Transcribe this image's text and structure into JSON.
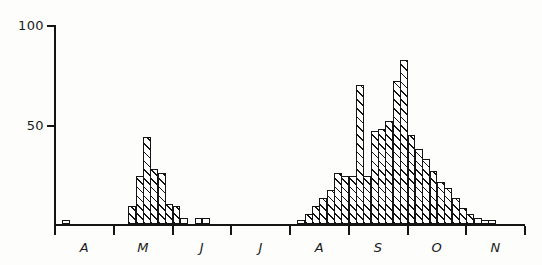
{
  "chart_data": {
    "type": "bar",
    "title": "",
    "subtitle": "",
    "xlabel": "",
    "ylabel": "",
    "xlim": [
      0,
      64
    ],
    "ylim": [
      0,
      100
    ],
    "grid": false,
    "legend": null,
    "note": "Histogram of weekly counts; bins are ~8.5 px wide, months April through November labelled by initial letter.",
    "yticks": [
      50,
      100
    ],
    "ytick_labels": [
      "50",
      "100"
    ],
    "month_labels": [
      "A",
      "M",
      "J",
      "J",
      "A",
      "S",
      "O",
      "N"
    ],
    "month_boundaries": [
      0,
      8,
      16,
      24,
      32,
      40,
      48,
      56,
      64
    ],
    "categories": [
      "A1",
      "A2",
      "A3",
      "A4",
      "A5",
      "A6",
      "A7",
      "A8",
      "M1",
      "M2",
      "M3",
      "M4",
      "M5",
      "M6",
      "M7",
      "M8",
      "J1",
      "J2",
      "J3",
      "J4",
      "J5",
      "J6",
      "J7",
      "J8",
      "J9",
      "J10",
      "J11",
      "J12",
      "J13",
      "J14",
      "J15",
      "J16",
      "A9",
      "A10",
      "A11",
      "A12",
      "A13",
      "A14",
      "A15",
      "A16",
      "S1",
      "S2",
      "S3",
      "S4",
      "S5",
      "S6",
      "S7",
      "S8",
      "O1",
      "O2",
      "O3",
      "O4",
      "O5",
      "O6",
      "O7",
      "O8",
      "N1",
      "N2",
      "N3",
      "N4",
      "N5",
      "N6",
      "N7",
      "N8"
    ],
    "values": [
      0,
      2,
      0,
      0,
      0,
      0,
      0,
      0,
      0,
      0,
      9,
      24,
      44,
      28,
      26,
      10,
      9,
      3,
      0,
      3,
      3,
      0,
      0,
      0,
      0,
      0,
      0,
      0,
      0,
      0,
      0,
      0,
      0,
      2,
      5,
      9,
      13,
      17,
      26,
      24,
      24,
      70,
      24,
      47,
      48,
      52,
      72,
      83,
      45,
      38,
      33,
      27,
      21,
      18,
      13,
      8,
      5,
      3,
      2,
      2,
      0,
      0,
      0,
      0
    ]
  },
  "axis": {
    "y_top_label": "100",
    "y_mid_label": "50"
  }
}
